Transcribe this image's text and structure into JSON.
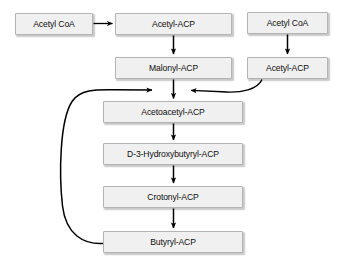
{
  "diagram": {
    "background_color": "#ffffff",
    "node_fill_color": "#f0f0f0",
    "node_border_color": "#b4b4b4",
    "edge_color": "#000000",
    "nodes": [
      {
        "id": "acetyl-coa-left",
        "label": "Acetyl CoA",
        "x": 15,
        "y": 13,
        "w": 78,
        "h": 22
      },
      {
        "id": "acetyl-acp-top",
        "label": "Acetyl-ACP",
        "x": 115,
        "y": 13,
        "w": 117,
        "h": 22
      },
      {
        "id": "acetyl-coa-right",
        "label": "Acetyl CoA",
        "x": 247,
        "y": 12,
        "w": 81,
        "h": 22
      },
      {
        "id": "malonyl-acp",
        "label": "Malonyl-ACP",
        "x": 115,
        "y": 57,
        "w": 117,
        "h": 22
      },
      {
        "id": "acetyl-acp-right",
        "label": "Acetyl-ACP",
        "x": 247,
        "y": 57,
        "w": 81,
        "h": 22
      },
      {
        "id": "acetoacetyl-acp",
        "label": "Acetoacetyl-ACP",
        "x": 103,
        "y": 101,
        "w": 140,
        "h": 22
      },
      {
        "id": "d3-hydroxybutyryl-acp",
        "label": "D-3-Hydroxybutyryl-ACP",
        "x": 103,
        "y": 143,
        "w": 140,
        "h": 22
      },
      {
        "id": "crotonyl-acp",
        "label": "Crotonyl-ACP",
        "x": 103,
        "y": 186,
        "w": 140,
        "h": 22
      },
      {
        "id": "butyryl-acp",
        "label": "Butyryl-ACP",
        "x": 103,
        "y": 231,
        "w": 140,
        "h": 22
      }
    ],
    "edges": [
      {
        "id": "e-acetylcoa-to-acetylacp",
        "from": "acetyl-coa-left",
        "to": "acetyl-acp-top",
        "shape": "horizontal-right"
      },
      {
        "id": "e-acetylacp-to-malonyl",
        "from": "acetyl-acp-top",
        "to": "malonyl-acp",
        "shape": "vertical-down"
      },
      {
        "id": "e-acetylcoa-right-to-acetylacp-right",
        "from": "acetyl-coa-right",
        "to": "acetyl-acp-right",
        "shape": "vertical-down"
      },
      {
        "id": "e-malonyl-to-acetoacetyl",
        "from": "malonyl-acp",
        "to": "acetoacetyl-acp",
        "shape": "vertical-down"
      },
      {
        "id": "e-acetylacp-right-to-junction",
        "from": "acetyl-acp-right",
        "to": "acetoacetyl-acp",
        "shape": "curve-left"
      },
      {
        "id": "e-butyryl-feedback-to-junction",
        "from": "butyryl-acp",
        "to": "acetoacetyl-acp",
        "shape": "curve-loop-left"
      },
      {
        "id": "e-acetoacetyl-to-hydroxybutyryl",
        "from": "acetoacetyl-acp",
        "to": "d3-hydroxybutyryl-acp",
        "shape": "vertical-down"
      },
      {
        "id": "e-hydroxybutyryl-to-crotonyl",
        "from": "d3-hydroxybutyryl-acp",
        "to": "crotonyl-acp",
        "shape": "vertical-down"
      },
      {
        "id": "e-crotonyl-to-butyryl",
        "from": "crotonyl-acp",
        "to": "butyryl-acp",
        "shape": "vertical-down"
      }
    ]
  }
}
